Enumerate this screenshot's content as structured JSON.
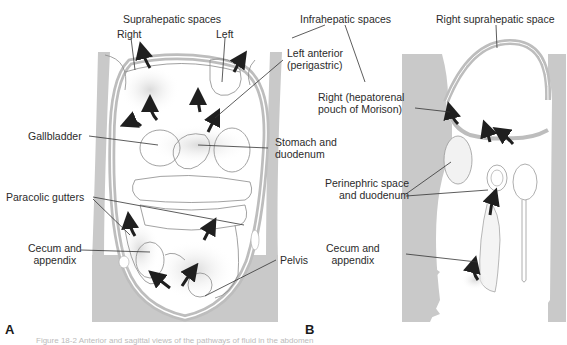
{
  "figure": {
    "panel_a": {
      "letter": "A",
      "labels": {
        "suprahepatic_spaces": "Suprahepatic spaces",
        "right": "Right",
        "left": "Left",
        "left_anterior_1": "Left anterior",
        "left_anterior_2": "(perigastric)",
        "gallbladder": "Gallbladder",
        "stomach_1": "Stomach and",
        "stomach_2": "duodenum",
        "paracolic": "Paracolic gutters",
        "cecum_1": "Cecum and",
        "cecum_2": "appendix",
        "pelvis": "Pelvis"
      }
    },
    "panel_b": {
      "letter": "B",
      "labels": {
        "infrahepatic_spaces": "Infrahepatic spaces",
        "right_suprahepatic": "Right suprahepatic space",
        "right_hepatorenal_1": "Right (hepatorenal",
        "right_hepatorenal_2": "pouch of Morison)",
        "perinephric_1": "Perinephric space",
        "perinephric_2": "and duodenum",
        "cecum_1": "Cecum and",
        "cecum_2": "appendix"
      }
    },
    "caption": "Figure 18-2  Anterior and sagittal views of the pathways of fluid in the abdomen",
    "colors": {
      "body_gray": "#c9c9c9",
      "peritoneum": "#bdbdbd",
      "arrow": "#1f1f1f",
      "line": "#333333"
    },
    "icons": [
      "flow-arrow-icon"
    ]
  }
}
